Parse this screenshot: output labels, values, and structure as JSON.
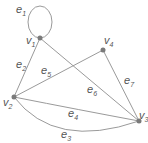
{
  "graph": {
    "colors": {
      "edge": "#9a9a9a",
      "vertex": "#7a7a7a",
      "label": "#555555",
      "background": "#ffffff"
    },
    "vertices": [
      {
        "id": "v1",
        "base": "v",
        "sub": "1",
        "x": 40,
        "y": 38,
        "lx": 26,
        "ly": 44
      },
      {
        "id": "v2",
        "base": "v",
        "sub": "2",
        "x": 14,
        "y": 97,
        "lx": 3,
        "ly": 106
      },
      {
        "id": "v3",
        "base": "v",
        "sub": "3",
        "x": 139,
        "y": 121,
        "lx": 140,
        "ly": 118
      },
      {
        "id": "v4",
        "base": "v",
        "sub": "4",
        "x": 103,
        "y": 50,
        "lx": 104,
        "ly": 44
      }
    ],
    "edges": [
      {
        "id": "e1",
        "base": "e",
        "sub": "1",
        "from": "v1",
        "to": "v1",
        "lx": 17,
        "ly": 13
      },
      {
        "id": "e2",
        "base": "e",
        "sub": "2",
        "from": "v1",
        "to": "v2",
        "lx": 17,
        "ly": 69
      },
      {
        "id": "e3",
        "base": "e",
        "sub": "3",
        "from": "v2",
        "to": "v3",
        "lx": 61,
        "ly": 139
      },
      {
        "id": "e4",
        "base": "e",
        "sub": "4",
        "from": "v2",
        "to": "v3",
        "lx": 68,
        "ly": 117
      },
      {
        "id": "e5",
        "base": "e",
        "sub": "5",
        "from": "v2",
        "to": "v4",
        "lx": 42,
        "ly": 73
      },
      {
        "id": "e6",
        "base": "e",
        "sub": "6",
        "from": "v1",
        "to": "v3",
        "lx": 88,
        "ly": 97
      },
      {
        "id": "e7",
        "base": "e",
        "sub": "7",
        "from": "v4",
        "to": "v3",
        "lx": 124,
        "ly": 84
      }
    ]
  }
}
